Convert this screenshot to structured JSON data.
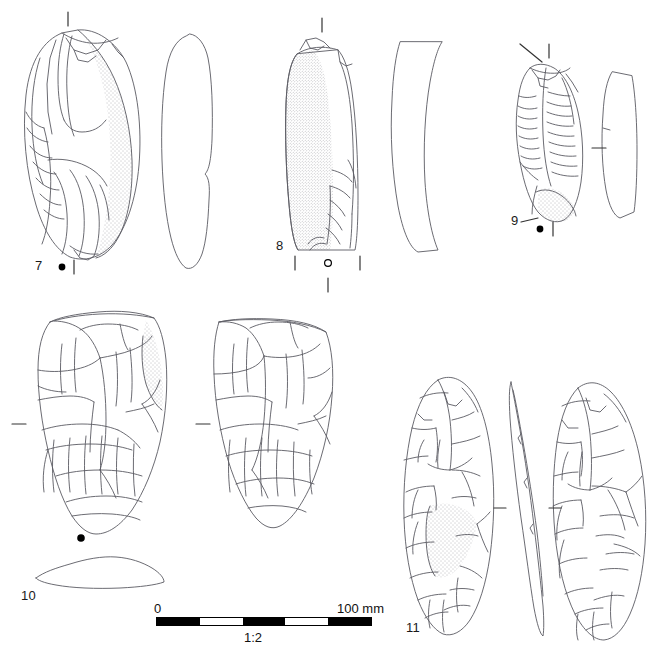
{
  "figure": {
    "kind": "archaeological-lithic-illustration-plate",
    "background_color": "#ffffff",
    "ink_color": "#5a5a62",
    "label_color": "#1a1a1a",
    "width": 667,
    "height": 652
  },
  "artifacts": [
    {
      "id": "artifact-7",
      "label": "7",
      "description": "elongated flake with cortex stippling, dorsal view plus right profile view",
      "views": [
        "dorsal",
        "profile"
      ],
      "markers": [
        "filled-dot",
        "vertical-tick"
      ]
    },
    {
      "id": "artifact-8",
      "label": "8",
      "description": "elongated blade-like flake with heavy cortex stippling, dorsal view plus curved profile view",
      "views": [
        "dorsal",
        "profile"
      ],
      "markers": [
        "open-circle",
        "vertical-tick"
      ]
    },
    {
      "id": "artifact-9",
      "label": "9",
      "description": "laminar flake with ripple scars, dorsal view plus profile view",
      "views": [
        "dorsal",
        "profile"
      ],
      "markers": [
        "filled-dot",
        "vertical-tick",
        "diagonal-tick"
      ]
    },
    {
      "id": "artifact-10",
      "label": "10",
      "description": "large broad biface fragment, two faces plus lens cross-section",
      "views": [
        "face-a",
        "face-b",
        "cross-section"
      ],
      "markers": [
        "filled-dot",
        "horizontal-tick"
      ]
    },
    {
      "id": "artifact-11",
      "label": "11",
      "description": "ovate bifacial handaxe, face-a, edge profile and face-b views",
      "views": [
        "face-a",
        "edge-profile",
        "face-b"
      ],
      "markers": [
        "horizontal-tick"
      ]
    }
  ],
  "scale": {
    "min_label": "0",
    "max_label": "100 mm",
    "ratio_label": "1:2",
    "segments": [
      "dark",
      "light",
      "dark",
      "light",
      "dark"
    ],
    "bar_color": "#000000"
  }
}
